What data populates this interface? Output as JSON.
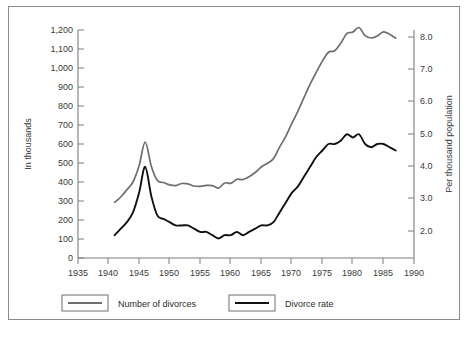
{
  "chart_data": {
    "type": "line",
    "title": "",
    "xlabel": "",
    "ylabel": "In thousands",
    "y2label": "Per thousand population",
    "xlim": [
      1935,
      1990
    ],
    "ylim": [
      0,
      1200
    ],
    "y2lim": [
      1.5,
      8.5
    ],
    "grid": false,
    "legend_position": "bottom",
    "xticks": [
      "1935",
      "1940",
      "1945",
      "1950",
      "1955",
      "1960",
      "1965",
      "1970",
      "1975",
      "1980",
      "1985",
      "1990"
    ],
    "yticks": [
      "0",
      "100",
      "200",
      "300",
      "400",
      "500",
      "600",
      "700",
      "800",
      "900",
      "1,000",
      "1,100",
      "1,200"
    ],
    "y2ticks": [
      "2.0",
      "3.0",
      "4.0",
      "5.0",
      "6.0",
      "7.0",
      "8.0"
    ],
    "x": [
      1941,
      1942,
      1943,
      1944,
      1945,
      1946,
      1947,
      1948,
      1949,
      1950,
      1951,
      1952,
      1953,
      1954,
      1955,
      1956,
      1957,
      1958,
      1959,
      1960,
      1961,
      1962,
      1963,
      1964,
      1965,
      1966,
      1967,
      1968,
      1969,
      1970,
      1971,
      1972,
      1973,
      1974,
      1975,
      1976,
      1977,
      1978,
      1979,
      1980,
      1981,
      1982,
      1983,
      1984,
      1985,
      1986,
      1987
    ],
    "series": [
      {
        "name": "Number of divorces",
        "axis": "left",
        "units": "thousands",
        "color": "#6e6e6e",
        "values": [
          293,
          321,
          359,
          400,
          485,
          610,
          483,
          408,
          397,
          385,
          381,
          392,
          390,
          379,
          377,
          382,
          381,
          368,
          395,
          393,
          414,
          413,
          428,
          450,
          479,
          499,
          523,
          584,
          639,
          708,
          773,
          845,
          915,
          977,
          1036,
          1083,
          1091,
          1130,
          1181,
          1189,
          1213,
          1170,
          1158,
          1169,
          1190,
          1178,
          1157
        ]
      },
      {
        "name": "Divorce rate",
        "axis": "right",
        "units": "per thousand population",
        "color": "#111111",
        "values": [
          2.2,
          2.4,
          2.6,
          2.9,
          3.5,
          4.3,
          3.4,
          2.8,
          2.7,
          2.6,
          2.5,
          2.5,
          2.5,
          2.4,
          2.3,
          2.3,
          2.2,
          2.1,
          2.2,
          2.2,
          2.3,
          2.2,
          2.3,
          2.4,
          2.5,
          2.5,
          2.6,
          2.9,
          3.2,
          3.5,
          3.7,
          4.0,
          4.3,
          4.6,
          4.8,
          5.0,
          5.0,
          5.1,
          5.3,
          5.2,
          5.3,
          5.0,
          4.9,
          5.0,
          5.0,
          4.9,
          4.8
        ]
      }
    ],
    "legend": [
      {
        "label": "Number of divorces",
        "color": "#6e6e6e"
      },
      {
        "label": "Divorce rate",
        "color": "#111111"
      }
    ]
  },
  "axes": {
    "left_title": "In thousands",
    "right_title": "Per thousand population"
  }
}
